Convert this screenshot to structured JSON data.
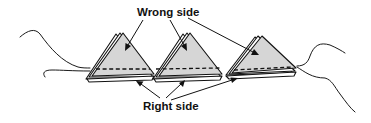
{
  "labels": {
    "top": "Wrong side",
    "bottom": "Right side"
  },
  "colors": {
    "fabric_fill": "#d6d6d6",
    "line": "#111111",
    "background": "#ffffff"
  },
  "elements": {
    "prairie_point_count": 3,
    "thread_ends": [
      "left",
      "right"
    ],
    "stitching": "dashed seam line across base of points"
  }
}
